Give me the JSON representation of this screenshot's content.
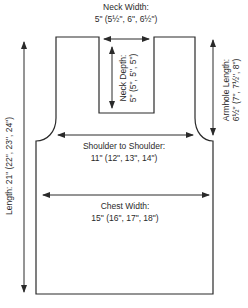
{
  "diagram": {
    "type": "garment-schematic",
    "colors": {
      "line": "#2a2a2a",
      "background": "#ffffff"
    },
    "measurements": {
      "neck_width": {
        "label": "Neck Width:",
        "value": "5\" (5½\", 6\", 6½\")"
      },
      "neck_depth": {
        "label": "Neck Depth:",
        "value": "5\" (5\", 5\", 5\")"
      },
      "armhole_length": {
        "label": "Armhole Length:",
        "value": "6½\" (7\", 7½\", 8\")"
      },
      "shoulder_to_shoulder": {
        "label": "Shoulder to Shoulder:",
        "value": "11\" (12\", 13\", 14\")"
      },
      "chest_width": {
        "label": "Chest Width:",
        "value": "15\" (16\", 17\", 18\")"
      },
      "length": {
        "label": "Length:",
        "value": "21\" (22\", 23\", 24\")",
        "full": "Length: 21\" (22\", 23\", 24\")"
      }
    }
  }
}
